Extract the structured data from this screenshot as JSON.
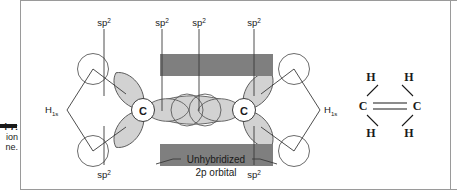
{
  "figure": {
    "margin_caption": {
      "rule_color": "#1a1a1a",
      "lines": [
        "i-7:",
        "ion",
        "ne."
      ]
    },
    "colors": {
      "lobe_fill": "#d2d2d2",
      "lobe_stroke": "#5a5a5a",
      "p_orbital_bar": "#7f7f7f",
      "line": "#3a3a3a",
      "text": "#1a1a1a",
      "frame": "#9a9a9a",
      "atom_circle_fill": "#ffffff"
    },
    "orbital_diagram": {
      "atom_labels": [
        "C",
        "C"
      ],
      "sp2_labels": [
        {
          "text": "sp",
          "sup": "2",
          "position": "top-left-outer"
        },
        {
          "text": "sp",
          "sup": "2",
          "position": "top-center-left"
        },
        {
          "text": "sp",
          "sup": "2",
          "position": "top-center-right"
        },
        {
          "text": "sp",
          "sup": "2",
          "position": "top-right-outer"
        },
        {
          "text": "sp",
          "sup": "2",
          "position": "bottom-left-outer"
        },
        {
          "text": "sp",
          "sup": "2",
          "position": "bottom-right-outer"
        }
      ],
      "hydrogen_labels": [
        {
          "text": "H",
          "sub": "1s",
          "position": "left"
        },
        {
          "text": "H",
          "sub": "1s",
          "position": "right"
        }
      ],
      "p_orbital_caption": {
        "line1": "Unhybridized",
        "line2": "2p orbital"
      }
    },
    "lewis_structure": {
      "carbons": [
        "C",
        "C"
      ],
      "hydrogens": [
        "H",
        "H",
        "H",
        "H"
      ],
      "bond_type": "double"
    }
  }
}
